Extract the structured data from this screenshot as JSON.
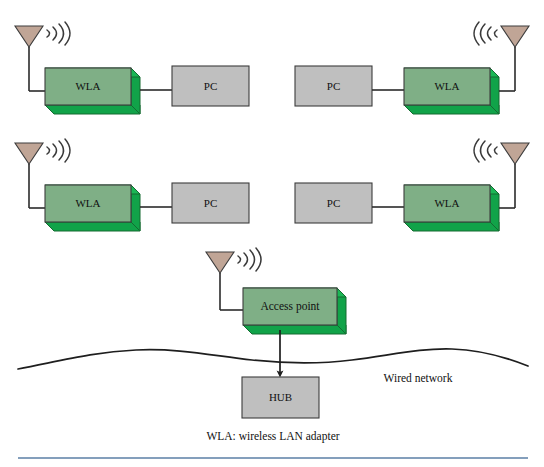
{
  "diagram": {
    "caption": "WLA: wireless LAN adapter",
    "wired_network_label": "Wired network",
    "colors": {
      "background": "#ffffff",
      "adapter_face": "#7faf86",
      "adapter_shadow": "#11a349",
      "pc_face": "#bfbfbf",
      "hub_face": "#bfbfbf",
      "antenna_fill": "#c0a596",
      "line": "#2b2b2b",
      "bottom_rule": "#5b7fa6"
    },
    "rows": [
      {
        "id": "row-1-left",
        "adapter_label": "WLA",
        "pc_label": "PC",
        "orientation": "antenna-left"
      },
      {
        "id": "row-1-right",
        "adapter_label": "WLA",
        "pc_label": "PC",
        "orientation": "antenna-right"
      },
      {
        "id": "row-2-left",
        "adapter_label": "WLA",
        "pc_label": "PC",
        "orientation": "antenna-left"
      },
      {
        "id": "row-2-right",
        "adapter_label": "WLA",
        "pc_label": "PC",
        "orientation": "antenna-right"
      }
    ],
    "access_point": {
      "label": "Access point",
      "orientation": "antenna-left"
    },
    "hub": {
      "label": "HUB"
    },
    "icons": {
      "antenna": "antenna-icon",
      "radio_waves": "radio-waves-icon",
      "arrow_down": "arrow-down-icon",
      "wavy_network": "wavy-network-line-icon"
    }
  }
}
